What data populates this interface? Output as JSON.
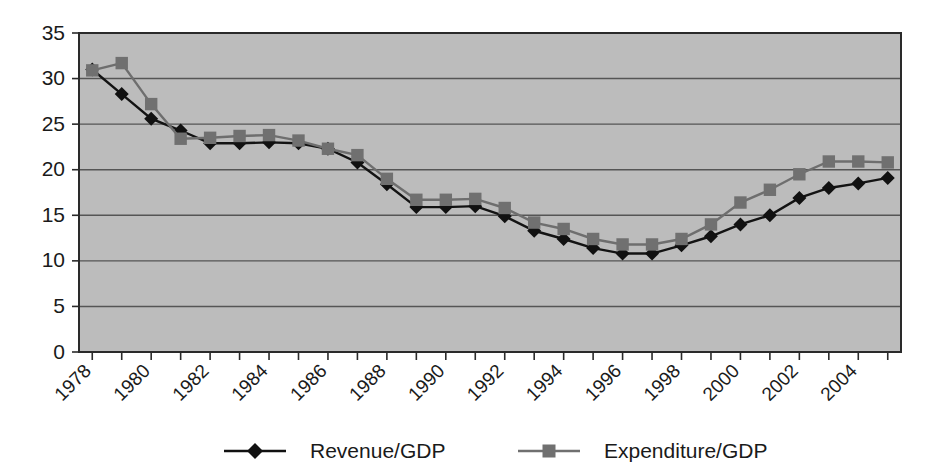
{
  "chart_data": {
    "type": "line",
    "title": "",
    "subtitle": "",
    "xlabel": "",
    "ylabel": "",
    "x": [
      1978,
      1979,
      1980,
      1981,
      1982,
      1983,
      1984,
      1985,
      1986,
      1987,
      1988,
      1989,
      1990,
      1991,
      1992,
      1993,
      1994,
      1995,
      1996,
      1997,
      1998,
      1999,
      2000,
      2001,
      2002,
      2003,
      2004,
      2005
    ],
    "xlim": [
      1977.55,
      2005.45
    ],
    "ylim": [
      0,
      35
    ],
    "yticks": [
      0,
      5,
      10,
      15,
      20,
      25,
      30,
      35
    ],
    "xticks": [
      1978,
      1980,
      1982,
      1984,
      1986,
      1988,
      1990,
      1992,
      1994,
      1996,
      1998,
      2000,
      2002,
      2004
    ],
    "xtick_labels": [
      "1978",
      "1980",
      "1982",
      "1984",
      "1986",
      "1988",
      "1990",
      "1992",
      "1994",
      "1996",
      "1998",
      "2000",
      "2002",
      "2004"
    ],
    "ytick_labels": [
      "0",
      "5",
      "10",
      "15",
      "20",
      "25",
      "30",
      "35"
    ],
    "xtick_rotation": 45,
    "grid": true,
    "grid_axis": "y",
    "plot_background": "#bcbcbc",
    "figure_background": "#ffffff",
    "legend_position": "bottom",
    "series": [
      {
        "name": "Revenue/GDP",
        "color": "#111111",
        "marker": "diamond",
        "values": [
          31.0,
          28.3,
          25.6,
          24.3,
          22.9,
          22.9,
          23.0,
          22.9,
          22.3,
          20.8,
          18.4,
          15.9,
          15.9,
          16.0,
          14.9,
          13.3,
          12.4,
          11.4,
          10.8,
          10.8,
          11.7,
          12.7,
          14.0,
          15.0,
          16.9,
          18.0,
          18.5,
          19.1
        ]
      },
      {
        "name": "Expenditure/GDP",
        "color": "#707070",
        "marker": "square",
        "values": [
          30.9,
          31.7,
          27.2,
          23.4,
          23.5,
          23.7,
          23.8,
          23.2,
          22.3,
          21.6,
          19.0,
          16.7,
          16.7,
          16.8,
          15.8,
          14.2,
          13.5,
          12.4,
          11.8,
          11.8,
          12.4,
          14.0,
          16.4,
          17.8,
          19.5,
          20.9,
          20.9,
          20.8
        ]
      }
    ]
  },
  "legend": {
    "items": [
      {
        "label": "Revenue/GDP",
        "marker": "diamond",
        "color": "#111111"
      },
      {
        "label": "Expenditure/GDP",
        "marker": "square",
        "color": "#707070"
      }
    ]
  }
}
